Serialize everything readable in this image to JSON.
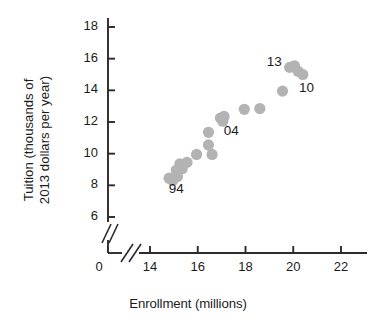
{
  "chart_data": {
    "type": "scatter",
    "title": "",
    "xlabel": "Enrollment (millions)",
    "ylabel_lines": [
      "Tuition (thousands of",
      "2013 dollars per year)"
    ],
    "ylabel": "Tuition (thousands of 2013 dollars per year)",
    "xlim": [
      13.0,
      22.6
    ],
    "ylim": [
      5.2,
      18.8
    ],
    "xticks": [
      14,
      16,
      18,
      20,
      22
    ],
    "yticks": [
      6,
      8,
      10,
      12,
      14,
      16,
      18
    ],
    "xtick_labels": [
      "14",
      "16",
      "18",
      "20",
      "22"
    ],
    "ytick_labels": [
      "6",
      "8",
      "10",
      "12",
      "14",
      "16",
      "18"
    ],
    "origin_label": "0",
    "axis_break_x": true,
    "axis_break_y": true,
    "grid": false,
    "legend": false,
    "marker_color": "#b3b3b3",
    "axis_color": "#2b2b2b",
    "points": [
      {
        "x": 14.8,
        "y": 8.45
      },
      {
        "x": 14.95,
        "y": 8.3
      },
      {
        "x": 15.1,
        "y": 8.95
      },
      {
        "x": 15.15,
        "y": 8.55
      },
      {
        "x": 15.25,
        "y": 9.35
      },
      {
        "x": 15.35,
        "y": 9.05
      },
      {
        "x": 15.55,
        "y": 9.45
      },
      {
        "x": 15.95,
        "y": 9.95
      },
      {
        "x": 16.45,
        "y": 11.35
      },
      {
        "x": 16.45,
        "y": 10.55
      },
      {
        "x": 16.6,
        "y": 9.95
      },
      {
        "x": 16.95,
        "y": 12.25
      },
      {
        "x": 17.05,
        "y": 12.05
      },
      {
        "x": 17.1,
        "y": 12.35
      },
      {
        "x": 17.95,
        "y": 12.8
      },
      {
        "x": 18.6,
        "y": 12.85
      },
      {
        "x": 19.55,
        "y": 13.95
      },
      {
        "x": 19.85,
        "y": 15.45
      },
      {
        "x": 20.05,
        "y": 15.55
      },
      {
        "x": 20.2,
        "y": 15.2
      },
      {
        "x": 20.4,
        "y": 15.0
      }
    ],
    "annotations": [
      {
        "text": "94",
        "x": 15.25,
        "y": 7.7
      },
      {
        "text": "04",
        "x": 17.55,
        "y": 11.35
      },
      {
        "text": "13",
        "x": 19.35,
        "y": 15.75
      },
      {
        "text": "10",
        "x": 20.7,
        "y": 14.1
      }
    ]
  }
}
